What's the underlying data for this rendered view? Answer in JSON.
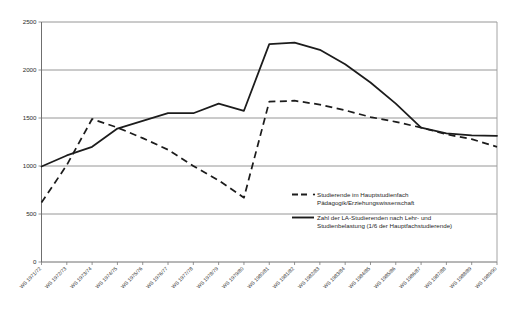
{
  "chart_data": {
    "type": "line",
    "title": "",
    "subtitle": "",
    "xlabel": "",
    "ylabel": "",
    "ylim": [
      0,
      2500
    ],
    "yticks": [
      0,
      500,
      1000,
      1500,
      2000,
      2500
    ],
    "grid": true,
    "legend_position": "inside-right-lower",
    "categories": [
      "WS 1971/72",
      "WS 1972/73",
      "WS 1973/74",
      "WS 1974/75",
      "WS 1975/76",
      "WS 1976/77",
      "WS 1977/78",
      "WS 1978/79",
      "WS 1979/80",
      "WS 1980/81",
      "WS 1981/82",
      "WS 1982/83",
      "WS 1983/84",
      "WS 1984/85",
      "WS 1985/86",
      "WS 1986/87",
      "WS 1987/88",
      "WS 1988/89",
      "WS 1989/90"
    ],
    "series": [
      {
        "name": "Studierende im Hauptstudienfach Pädagogik/Erziehungswissenschaft",
        "style": "dashed",
        "color": "#1c1c1c",
        "values": [
          620,
          1010,
          1490,
          1400,
          1290,
          1170,
          1000,
          850,
          670,
          1670,
          1680,
          1640,
          1580,
          1510,
          1460,
          1400,
          1330,
          1280,
          1200
        ]
      },
      {
        "name": "Zahl der LA-Studierenden nach Lehr- und Studienbelastung (1/6 der Hauptfachstudierende)",
        "style": "solid",
        "color": "#1c1c1c",
        "values": [
          995,
          1110,
          1200,
          1390,
          1470,
          1550,
          1550,
          1650,
          1575,
          2270,
          2285,
          2210,
          2060,
          1870,
          1650,
          1400,
          1340,
          1320,
          1315
        ]
      }
    ]
  },
  "legend": {
    "entries": [
      {
        "line1": "Studierende im Hauptstudienfach",
        "line2": "Pädagogik/Erziehungswissenschaft",
        "style": "dashed"
      },
      {
        "line1": "Zahl der LA-Studierenden nach Lehr- und",
        "line2": "Studienbelastung (1/6 der Hauptfachstudierende)",
        "style": "solid"
      }
    ]
  },
  "axis": {
    "y_labels": [
      "2500",
      "2000",
      "1500",
      "1000",
      "500",
      "0"
    ],
    "x_labels": [
      "WS 1971/72",
      "WS 1972/73",
      "WS 1973/74",
      "WS 1974/75",
      "WS 1975/76",
      "WS 1976/77",
      "WS 1977/78",
      "WS 1978/79",
      "WS 1979/80",
      "WS 1980/81",
      "WS 1981/82",
      "WS 1982/83",
      "WS 1983/84",
      "WS 1984/85",
      "WS 1985/86",
      "WS 1986/87",
      "WS 1987/88",
      "WS 1988/89",
      "WS 1989/90"
    ]
  },
  "colors": {
    "series_line": "#1c1c1c",
    "grid": "#8a8a8a",
    "axis": "#6f6f6f",
    "background": "#ffffff"
  }
}
